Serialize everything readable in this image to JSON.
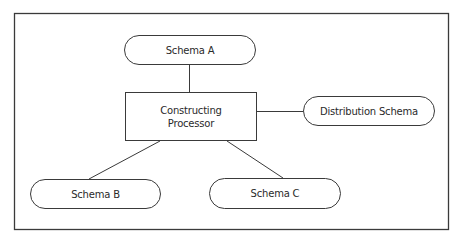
{
  "diagram": {
    "type": "hub-and-spoke",
    "colors": {
      "stroke": "#3a3a3a",
      "text": "#2a2a2a",
      "background": "#ffffff"
    },
    "nodes": [
      {
        "id": "schema_a",
        "shape": "pill",
        "label": "Schema A"
      },
      {
        "id": "processor",
        "shape": "rectangle",
        "label_line1": "Constructing",
        "label_line2": "Processor"
      },
      {
        "id": "distribution",
        "shape": "pill",
        "label": "Distribution Schema"
      },
      {
        "id": "schema_b",
        "shape": "pill",
        "label": "Schema B"
      },
      {
        "id": "schema_c",
        "shape": "pill",
        "label": "Schema C"
      }
    ],
    "edges": [
      {
        "from": "schema_a",
        "to": "processor"
      },
      {
        "from": "processor",
        "to": "distribution"
      },
      {
        "from": "processor",
        "to": "schema_b"
      },
      {
        "from": "processor",
        "to": "schema_c"
      }
    ]
  }
}
